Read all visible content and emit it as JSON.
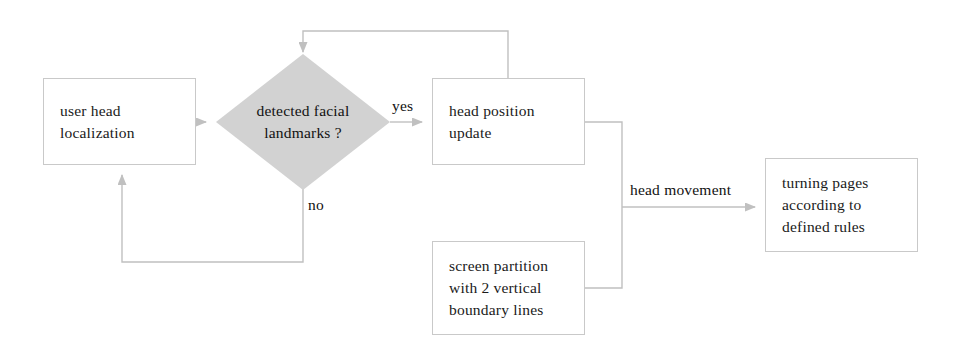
{
  "diagram": {
    "colors": {
      "edge": "#c0c0c0",
      "node_border": "#c9c9c9",
      "decision_fill": "#d2d2d2",
      "text": "#111111",
      "background": "#ffffff"
    }
  },
  "nodes": {
    "user_head_localization": {
      "lines": [
        "user head",
        "localization"
      ],
      "line1": "user head",
      "line2": "localization"
    },
    "detected_facial_landmarks": {
      "lines": [
        "detected facial",
        "landmarks ?"
      ],
      "line1": "detected facial",
      "line2": "landmarks ?"
    },
    "head_position_update": {
      "lines": [
        "head position",
        "update"
      ],
      "line1": "head position",
      "line2": "update"
    },
    "screen_partition": {
      "lines": [
        "screen partition",
        "with 2 vertical",
        "boundary lines"
      ],
      "line1": "screen partition",
      "line2": "with 2 vertical",
      "line3": "boundary lines"
    },
    "turning_pages": {
      "lines": [
        "turning pages",
        "according to",
        "defined rules"
      ],
      "line1": "turning pages",
      "line2": "according to",
      "line3": "defined rules"
    }
  },
  "edge_labels": {
    "yes": "yes",
    "no": "no",
    "head_movement": "head movement"
  }
}
